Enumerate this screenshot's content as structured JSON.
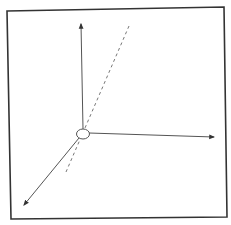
{
  "diagram": {
    "type": "3d-coordinate-axes",
    "colors": {
      "background": "#ffffff",
      "frame": "#333333",
      "axis": "#555555",
      "dashed_line": "#777777",
      "origin_fill": "#ffffff"
    },
    "frame": {
      "points": "7,11 224,7 227,217 11,219"
    },
    "origin": {
      "cx": 83,
      "cy": 134,
      "rx": 6.5,
      "ry": 5
    },
    "axes": [
      {
        "name": "vertical-axis",
        "x1": 83,
        "y1": 129,
        "x2": 81,
        "y2": 24
      },
      {
        "name": "horizontal-axis",
        "x1": 89,
        "y1": 133,
        "x2": 214,
        "y2": 137
      },
      {
        "name": "depth-axis",
        "x1": 79,
        "y1": 138,
        "x2": 24,
        "y2": 205
      }
    ],
    "dashed_line": {
      "x1": 129,
      "y1": 26,
      "x2": 66,
      "y2": 172
    }
  }
}
